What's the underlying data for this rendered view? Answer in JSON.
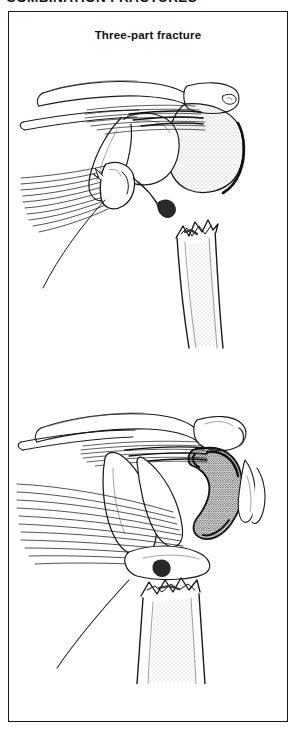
{
  "header": {
    "running_title": "COMBINATION FRACTURES",
    "clipped": true
  },
  "figure": {
    "title": "Three-part fracture",
    "border_color": "#1a1a1a",
    "background_color": "#ffffff",
    "ink_color": "#1a1a1a"
  },
  "illustrations": [
    {
      "id": "upper-panel",
      "name": "three-part-fracture-anterior-view",
      "description": "Anterior view line drawing of the shoulder showing a three-part proximal humerus fracture with clavicle, acromion, coracoid, greater tuberosity fragment retracted by radiating rotator cuff fibers, and jagged humeral shaft fracture edge",
      "structures": [
        "clavicle",
        "acromion",
        "coracoid process",
        "glenoid",
        "humeral head",
        "greater tuberosity fragment",
        "lesser tuberosity",
        "rotator cuff muscle fibers",
        "humeral shaft",
        "jagged fracture line"
      ],
      "shading": "stipple"
    },
    {
      "id": "lower-panel",
      "name": "three-part-fracture-displaced-view",
      "description": "Second line drawing of the same shoulder with the displaced dark stippled tuberosity fragment rotated laterally, long radiating muscle fibers pulling it away, and the humeral shaft with jagged fracture margin below",
      "structures": [
        "clavicle",
        "acromion",
        "coracoid process",
        "displaced tuberosity fragment",
        "biceps tendon",
        "rotator cuff muscle fibers",
        "humeral head",
        "humeral shaft",
        "jagged fracture line"
      ],
      "shading": "dense stipple"
    }
  ]
}
